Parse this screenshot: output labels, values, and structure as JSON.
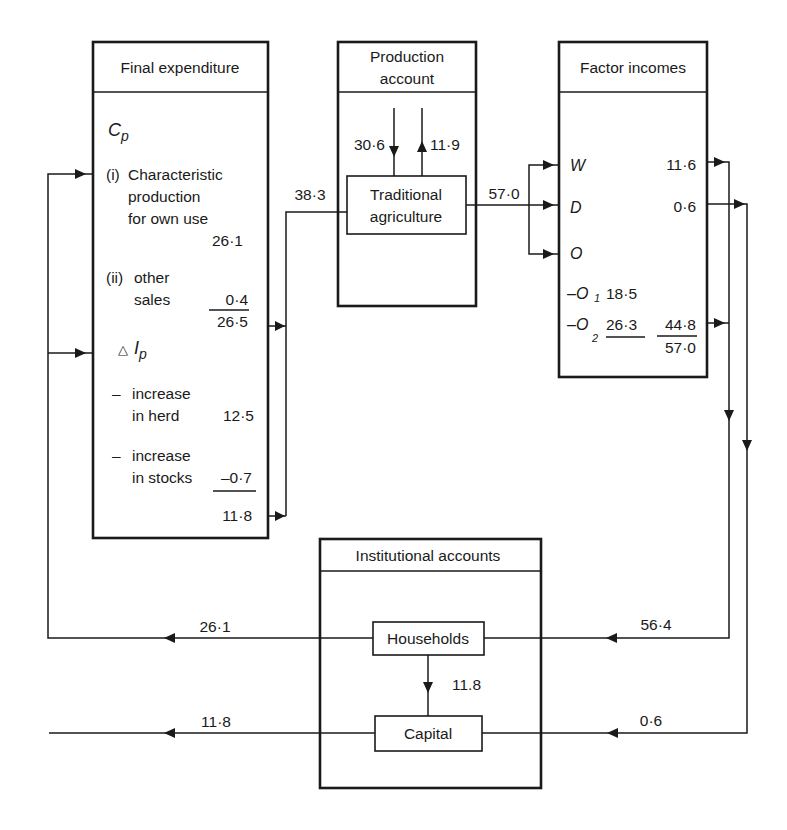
{
  "diagram": {
    "final_expenditure": {
      "title": "Final expenditure",
      "cp_label": "C",
      "cp_sub": "p",
      "item_i_prefix": "(i)",
      "item_i_line1": "Characteristic",
      "item_i_line2": "production",
      "item_i_line3": "for own use",
      "item_i_value": "26·1",
      "item_ii_prefix": "(ii)",
      "item_ii_line1": "other",
      "item_ii_line2": "sales",
      "item_ii_value": "0·4",
      "cp_total": "26·5",
      "ip_delta": "△",
      "ip_label": "I",
      "ip_sub": "p",
      "herd_dash": "–",
      "herd_line1": "increase",
      "herd_line2": "in herd",
      "herd_value": "12·5",
      "stocks_dash": "–",
      "stocks_line1": "increase",
      "stocks_line2": "in stocks",
      "stocks_value": "–0·7",
      "ip_total": "11·8"
    },
    "production_account": {
      "title_line1": "Production",
      "title_line2": "account",
      "inflow_value": "30·6",
      "outflow_value": "11·9",
      "sub_box_line1": "Traditional",
      "sub_box_line2": "agriculture"
    },
    "factor_incomes": {
      "title": "Factor incomes",
      "w_label": "W",
      "w_value": "11·6",
      "d_label": "D",
      "d_value": "0·6",
      "o_label": "O",
      "o1_label": "–O",
      "o1_sub": "1",
      "o1_value": "18·5",
      "o2_label": "–O",
      "o2_sub": "2",
      "o2_value": "26·3",
      "o_total": "44·8",
      "grand_total": "57·0"
    },
    "institutional_accounts": {
      "title": "Institutional accounts",
      "households_label": "Households",
      "capital_label": "Capital",
      "households_to_capital": "11.8"
    },
    "flows": {
      "fe_to_production": "38·3",
      "production_to_factor": "57·0",
      "households_to_fe": "26·1",
      "capital_out": "11·8",
      "factor_to_households": "56·4",
      "factor_to_capital": "0·6"
    }
  }
}
